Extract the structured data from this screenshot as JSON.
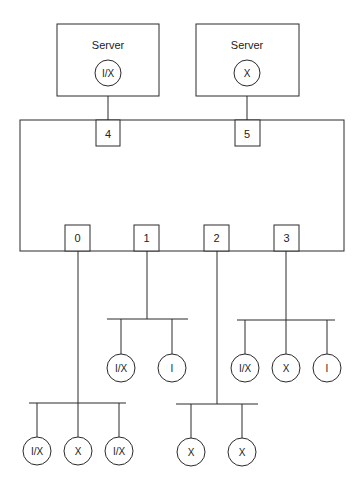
{
  "diagram": {
    "servers": [
      {
        "label": "Server",
        "node": "I/X"
      },
      {
        "label": "Server",
        "node": "X"
      }
    ],
    "switch_ports_top": [
      "4",
      "5"
    ],
    "switch_ports_bottom": [
      "0",
      "1",
      "2",
      "3"
    ],
    "port_0_nodes": [
      "I/X",
      "X",
      "I/X"
    ],
    "port_1_nodes": [
      "I/X",
      "I"
    ],
    "port_2_nodes": [
      "X",
      "X"
    ],
    "port_3_nodes": [
      "I/X",
      "X",
      "I"
    ]
  },
  "colors": {
    "line": "#2a2a2a",
    "background": "#ffffff"
  }
}
